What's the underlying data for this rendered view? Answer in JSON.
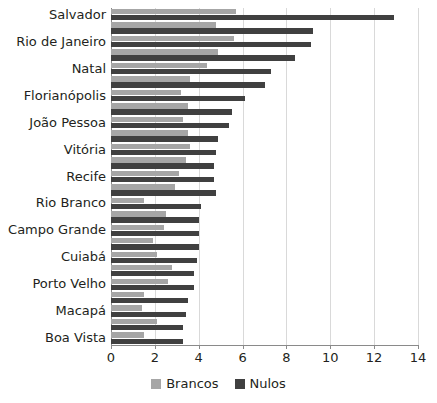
{
  "chart_data": {
    "type": "bar",
    "orientation": "horizontal",
    "title": "",
    "xlabel": "",
    "ylabel": "",
    "xlim": [
      0,
      14
    ],
    "xticks": [
      0,
      2,
      4,
      6,
      8,
      10,
      12,
      14
    ],
    "xtick_labels": [
      "0",
      "2",
      "4",
      "6",
      "8",
      "10",
      "12",
      "14"
    ],
    "grid": "vertical",
    "legend_position": "bottom-center",
    "categories": [
      "Salvador",
      "Fortaleza",
      "Rio de Janeiro",
      "Maceió",
      "Natal",
      "São Luís",
      "Florianópolis",
      "Belém",
      "João Pessoa",
      "Aracaju",
      "Vitória",
      "Teresina",
      "Recife",
      "Palmas",
      "Rio Branco",
      "Manaus",
      "Campo Grande",
      "Goiânia",
      "Cuiabá",
      "Belo Horizonte",
      "Porto Velho",
      "Curitiba",
      "Macapá",
      "Porto Alegre",
      "Boa Vista"
    ],
    "visible_tick_labels": [
      "Salvador",
      "Rio de Janeiro",
      "Natal",
      "Florianópolis",
      "João Pessoa",
      "Vitória",
      "Recife",
      "Rio Branco",
      "Campo Grande",
      "Cuiabá",
      "Porto Velho",
      "Macapá",
      "Boa Vista"
    ],
    "series": [
      {
        "name": "Brancos",
        "color": "#a6a6a6",
        "values": [
          5.7,
          4.8,
          5.6,
          4.9,
          4.4,
          3.6,
          3.2,
          3.5,
          3.3,
          3.5,
          3.6,
          3.4,
          3.1,
          2.9,
          1.5,
          2.5,
          2.4,
          1.9,
          2.1,
          2.8,
          2.6,
          1.5,
          1.4,
          2.1,
          1.5
        ]
      },
      {
        "name": "Nulos",
        "color": "#404040",
        "values": [
          12.9,
          9.2,
          9.1,
          8.4,
          7.3,
          7.0,
          6.1,
          5.5,
          5.4,
          4.9,
          4.8,
          4.7,
          4.7,
          4.8,
          4.1,
          4.0,
          4.0,
          4.0,
          3.9,
          3.8,
          3.8,
          3.5,
          3.4,
          3.3,
          3.3
        ]
      }
    ]
  },
  "legend": {
    "items": [
      {
        "label": "Brancos",
        "swatch": "brancos-swatch"
      },
      {
        "label": "Nulos",
        "swatch": "nulos-swatch"
      }
    ]
  }
}
